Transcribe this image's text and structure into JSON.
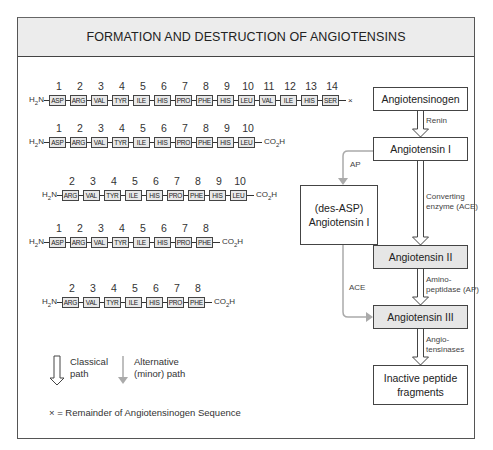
{
  "title": "FORMATION AND DESTRUCTION OF ANGIOTENSINS",
  "sequences": [
    {
      "id": "angiotensinogen",
      "n_terminus": "H2N",
      "positions": [
        "1",
        "2",
        "3",
        "4",
        "5",
        "6",
        "7",
        "8",
        "9",
        "10",
        "11",
        "12",
        "13",
        "14"
      ],
      "residues": [
        "ASP",
        "ARG",
        "VAL",
        "TYR",
        "ILE",
        "HIS",
        "PRO",
        "PHE",
        "HIS",
        "LEU",
        "VAL",
        "ILE",
        "HIS",
        "SER"
      ],
      "c_terminus": "×"
    },
    {
      "id": "angiotensin-i",
      "n_terminus": "H2N",
      "positions": [
        "1",
        "2",
        "3",
        "4",
        "5",
        "6",
        "7",
        "8",
        "9",
        "10"
      ],
      "residues": [
        "ASP",
        "ARG",
        "VAL",
        "TYR",
        "ILE",
        "HIS",
        "PRO",
        "PHE",
        "HIS",
        "LEU"
      ],
      "c_terminus": "CO2H"
    },
    {
      "id": "des-asp-angiotensin-i",
      "n_terminus": "H2N",
      "positions": [
        "2",
        "3",
        "4",
        "5",
        "6",
        "7",
        "8",
        "9",
        "10"
      ],
      "residues": [
        "ARG",
        "VAL",
        "TYR",
        "ILE",
        "HIS",
        "PRO",
        "PHE",
        "HIS",
        "LEU"
      ],
      "c_terminus": "CO2H"
    },
    {
      "id": "angiotensin-ii",
      "n_terminus": "H2N",
      "positions": [
        "1",
        "2",
        "3",
        "4",
        "5",
        "6",
        "7",
        "8"
      ],
      "residues": [
        "ASP",
        "ARG",
        "VAL",
        "TYR",
        "ILE",
        "HIS",
        "PRO",
        "PHE"
      ],
      "c_terminus": "CO2H"
    },
    {
      "id": "angiotensin-iii",
      "n_terminus": "H2N",
      "positions": [
        "2",
        "3",
        "4",
        "5",
        "6",
        "7",
        "8"
      ],
      "residues": [
        "ARG",
        "VAL",
        "TYR",
        "ILE",
        "HIS",
        "PRO",
        "PHE"
      ],
      "c_terminus": "CO2H"
    }
  ],
  "flow": {
    "boxes": {
      "angiotensinogen": "Angiotensinogen",
      "angiotensin_i": "Angiotensin I",
      "des_asp_line1": "(des-ASP)",
      "des_asp_line2": "Angiotensin I",
      "angiotensin_ii": "Angiotensin II",
      "angiotensin_iii": "Angiotensin III",
      "inactive_line1": "Inactive peptide",
      "inactive_line2": "fragments"
    },
    "enzymes": {
      "renin": "Renin",
      "ap": "AP",
      "ace_alt": "ACE",
      "converting_line1": "Converting",
      "converting_line2": "enzyme (ACE)",
      "aminopeptidase_line1": "Amino-",
      "aminopeptidase_line2": "peptidase (AP)",
      "angiotensinases_line1": "Angio-",
      "angiotensinases_line2": "tensinases"
    }
  },
  "legend": {
    "classical_line1": "Classical",
    "classical_line2": "path",
    "alternative_line1": "Alternative",
    "alternative_line2": "(minor) path"
  },
  "footnote": "× = Remainder of Angiotensinogen Sequence",
  "colors": {
    "gray_box": "#e6e6e6",
    "title_bg": "#ececec",
    "alt_path": "#aaaaaa",
    "line": "#444444"
  }
}
